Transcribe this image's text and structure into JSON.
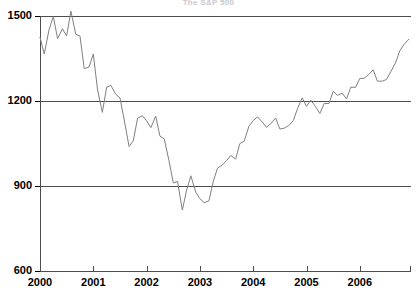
{
  "chart_data": {
    "type": "line",
    "title": "The S&P 500",
    "xlabel": "",
    "ylabel": "",
    "ylim": [
      600,
      1500
    ],
    "xlim": [
      2000.0,
      2006.96
    ],
    "grid": true,
    "grid_axis": "y",
    "legend": "none",
    "line_color": "#808080",
    "yticks": [
      600,
      900,
      1200,
      1500
    ],
    "xticks": [
      2000,
      2001,
      2002,
      2003,
      2004,
      2005,
      2006
    ],
    "series": [
      {
        "name": "S&P 500",
        "x": [
          2000.0,
          2000.08,
          2000.17,
          2000.25,
          2000.33,
          2000.42,
          2000.5,
          2000.58,
          2000.67,
          2000.75,
          2000.83,
          2000.92,
          2001.0,
          2001.08,
          2001.17,
          2001.25,
          2001.33,
          2001.42,
          2001.5,
          2001.58,
          2001.67,
          2001.75,
          2001.83,
          2001.92,
          2002.0,
          2002.08,
          2002.17,
          2002.25,
          2002.33,
          2002.42,
          2002.5,
          2002.58,
          2002.67,
          2002.75,
          2002.83,
          2002.92,
          2003.0,
          2003.08,
          2003.17,
          2003.25,
          2003.33,
          2003.42,
          2003.5,
          2003.58,
          2003.67,
          2003.75,
          2003.83,
          2003.92,
          2004.0,
          2004.08,
          2004.17,
          2004.25,
          2004.33,
          2004.42,
          2004.5,
          2004.58,
          2004.67,
          2004.75,
          2004.83,
          2004.92,
          2005.0,
          2005.08,
          2005.17,
          2005.25,
          2005.33,
          2005.42,
          2005.5,
          2005.58,
          2005.67,
          2005.75,
          2005.83,
          2005.92,
          2006.0,
          2006.08,
          2006.17,
          2006.25,
          2006.33,
          2006.42,
          2006.5,
          2006.58,
          2006.67,
          2006.75,
          2006.83,
          2006.92
        ],
        "values": [
          1425,
          1366,
          1452,
          1498,
          1420,
          1455,
          1430,
          1517,
          1436,
          1429,
          1314,
          1320,
          1366,
          1239,
          1160,
          1249,
          1255,
          1224,
          1211,
          1133,
          1040,
          1059,
          1139,
          1148,
          1130,
          1106,
          1147,
          1076,
          1067,
          989,
          911,
          916,
          815,
          885,
          936,
          879,
          855,
          841,
          848,
          916,
          963,
          974,
          990,
          1008,
          995,
          1050,
          1058,
          1111,
          1131,
          1144,
          1126,
          1107,
          1120,
          1140,
          1101,
          1104,
          1114,
          1130,
          1173,
          1211,
          1181,
          1203,
          1180,
          1156,
          1191,
          1191,
          1234,
          1220,
          1228,
          1207,
          1249,
          1248,
          1280,
          1280,
          1294,
          1310,
          1270,
          1270,
          1276,
          1303,
          1335,
          1377,
          1400,
          1418
        ]
      }
    ]
  },
  "axes": {
    "ytick_labels": [
      "1500",
      "1200",
      "900",
      "600"
    ],
    "xtick_labels": [
      "2000",
      "2001",
      "2002",
      "2003",
      "2004",
      "2005",
      "2006"
    ]
  }
}
